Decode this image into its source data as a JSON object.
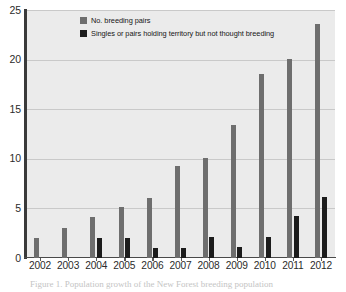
{
  "chart_data": {
    "type": "bar",
    "title": "",
    "subtitle": "",
    "xlabel": "",
    "ylabel": "",
    "categories": [
      "2002",
      "2003",
      "2004",
      "2005",
      "2006",
      "2007",
      "2008",
      "2009",
      "2010",
      "2011",
      "2012"
    ],
    "series": [
      {
        "name": "No. breeding pairs",
        "color": "#6e6e6e",
        "values": [
          2,
          3,
          4.1,
          5.1,
          6.1,
          9.3,
          10.1,
          13.4,
          18.5,
          20.1,
          23.6
        ]
      },
      {
        "name": "Singles or pairs holding territory but not thought breeding",
        "color": "#1c1c1c",
        "values": [
          0,
          0,
          2,
          2,
          1,
          1,
          2.1,
          1.1,
          2.1,
          4.2,
          6.2
        ]
      }
    ],
    "ylim": [
      0,
      25
    ],
    "yticks": [
      0,
      5,
      10,
      15,
      20,
      25
    ],
    "ytick_labels": [
      "0",
      "5",
      "10",
      "15",
      "20",
      "25"
    ],
    "grid": true,
    "grid_axis": "y",
    "legend_position": "upper-left-inside",
    "plot_background": "#ebebeb",
    "figure_background": "#ffffff"
  },
  "legend": {
    "entries": [
      {
        "label": "No. breeding pairs",
        "swatch": "breeding"
      },
      {
        "label": "Singles or pairs holding territory but not thought breeding",
        "swatch": "singles"
      }
    ]
  },
  "caption": {
    "text": "Figure 1. Population growth of the New Forest breeding population"
  }
}
